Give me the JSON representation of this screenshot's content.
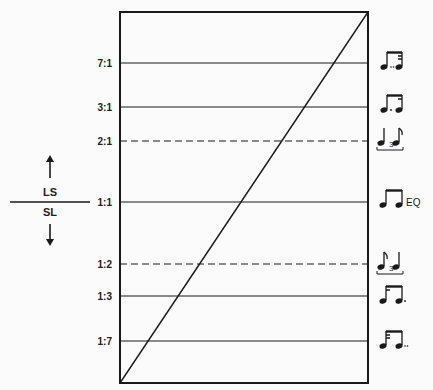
{
  "diagram": {
    "type": "ratio-continuum",
    "frame": {
      "x1": 120,
      "y1": 12,
      "x2": 368,
      "y2": 383
    },
    "diagonal": {
      "from": "bottom-left",
      "to": "top-right"
    },
    "side_legend": {
      "upper_label": "LS",
      "lower_label": "SL",
      "upper_arrow": "up-arrow",
      "lower_arrow": "down-arrow"
    },
    "ratios": [
      {
        "label": "7:1",
        "y": 63,
        "style": "solid",
        "rhythm": "double-dotted-eighth-thirtysecond",
        "suffix": ""
      },
      {
        "label": "3:1",
        "y": 107,
        "style": "solid",
        "rhythm": "dotted-eighth-sixteenth",
        "suffix": ""
      },
      {
        "label": "2:1",
        "y": 141,
        "style": "dashed",
        "rhythm": "triplet-quarter-eighth",
        "suffix": "3"
      },
      {
        "label": "1:1",
        "y": 202,
        "style": "solid",
        "rhythm": "even-eighths",
        "suffix": "EQ"
      },
      {
        "label": "1:2",
        "y": 264,
        "style": "dashed",
        "rhythm": "triplet-eighth-quarter",
        "suffix": "3"
      },
      {
        "label": "1:3",
        "y": 296,
        "style": "solid",
        "rhythm": "sixteenth-dotted-eighth",
        "suffix": ""
      },
      {
        "label": "1:7",
        "y": 341,
        "style": "solid",
        "rhythm": "thirtysecond-double-dotted-eighth",
        "suffix": ""
      }
    ]
  }
}
